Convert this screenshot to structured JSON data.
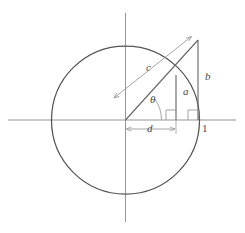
{
  "figure": {
    "type": "geometry-diagram",
    "background_color": "#ffffff",
    "canvas": {
      "width": 245,
      "height": 233
    },
    "colors": {
      "circle_stroke": "#555555",
      "axis_stroke": "#8a8a8a",
      "triangle_stroke": "#6b6b6b",
      "dimension_stroke": "#9a9a9a",
      "label_text": "#4a4a4a"
    },
    "geometry": {
      "circle": {
        "cx": 125.5,
        "cy": 120,
        "r": 74
      },
      "x_axis": {
        "x1": 8,
        "y1": 120,
        "x2": 236,
        "y2": 120
      },
      "y_axis": {
        "x1": 125.5,
        "y1": 13,
        "x2": 125.5,
        "y2": 222
      },
      "origin": {
        "x": 125.5,
        "y": 120
      },
      "hypotenuse": {
        "x1": 125.5,
        "y1": 120,
        "x2": 198,
        "y2": 40
      },
      "segment_a": {
        "x": 176,
        "y_top": 75,
        "y_bottom": 120
      },
      "segment_b": {
        "x": 198,
        "y_top": 40,
        "y_bottom": 120
      },
      "right_angle_a": {
        "x": 166,
        "y": 110,
        "size": 10
      },
      "right_angle_b": {
        "x": 188,
        "y": 110,
        "size": 10
      },
      "dimension_c": {
        "x1": 113,
        "y1": 99,
        "x2": 193,
        "y2": 35
      },
      "dimension_d": {
        "x1": 126,
        "y1": 129,
        "x2": 176,
        "y2": 129
      },
      "unit_point": {
        "x": 199.5,
        "y": 120
      }
    }
  },
  "labels": {
    "c": {
      "text": "c",
      "x": 146,
      "y": 67
    },
    "b": {
      "text": "b",
      "x": 205,
      "y": 76
    },
    "a": {
      "text": "a",
      "x": 183,
      "y": 91
    },
    "d": {
      "text": "d",
      "x": 147,
      "y": 123
    },
    "theta": {
      "text": "θ",
      "x": 150,
      "y": 99
    },
    "one": {
      "text": "1",
      "x": 202,
      "y": 123
    }
  }
}
